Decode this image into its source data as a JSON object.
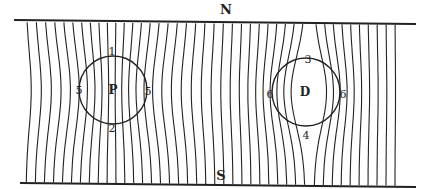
{
  "diagram": {
    "type": "magnetic-field-lines",
    "poles": {
      "north": "N",
      "south": "S"
    },
    "bodies": [
      {
        "id": "P",
        "label": "P",
        "cx": 113,
        "cy": 90,
        "r": 34,
        "markers": {
          "top": "1",
          "bottom": "2",
          "left": "5",
          "right": "5"
        }
      },
      {
        "id": "D",
        "label": "D",
        "cx": 306,
        "cy": 92,
        "r": 34,
        "markers": {
          "top": "3",
          "bottom": "4",
          "left": "6",
          "right": "6"
        }
      }
    ],
    "field": {
      "x_start": 26,
      "x_end": 398,
      "spacing": 9,
      "top_y": 22,
      "bottom_y": 184
    },
    "colors": {
      "ink": "#222222",
      "paper": "#ffffff"
    }
  }
}
